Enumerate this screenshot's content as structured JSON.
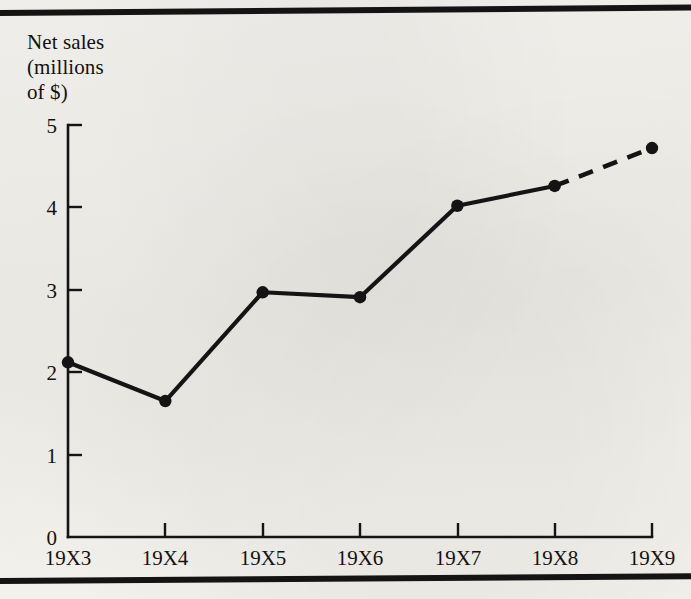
{
  "figure": {
    "axis_title": "Net sales\n(millions\nof $)",
    "ink_color": "#141414",
    "paper_color": "#f2f0ec"
  },
  "chart_data": {
    "type": "line",
    "title": "",
    "subtitle": "",
    "xlabel": "",
    "ylabel": "Net sales (millions of $)",
    "categories": [
      "19X3",
      "19X4",
      "19X5",
      "19X6",
      "19X7",
      "19X8",
      "19X9"
    ],
    "values": [
      2.12,
      1.65,
      2.97,
      2.91,
      4.02,
      4.26,
      4.72
    ],
    "series": [
      {
        "name": "Net sales",
        "values": [
          2.12,
          1.65,
          2.97,
          2.91,
          4.02,
          4.26,
          4.72
        ]
      }
    ],
    "ylim": [
      0,
      5
    ],
    "ytick_labels": [
      "0",
      "1",
      "2",
      "3",
      "4",
      "5"
    ],
    "ytick_values": [
      0,
      1,
      2,
      3,
      4,
      5
    ],
    "xtick_labels": [
      "19X3",
      "19X4",
      "19X5",
      "19X6",
      "19X7",
      "19X8",
      "19X9"
    ],
    "grid": false,
    "legend": false,
    "legend_position": "none",
    "markers": "filled-circle",
    "line_style": "solid",
    "projected_segment": {
      "from": "19X8",
      "to": "19X9",
      "style": "dashed"
    },
    "annotations": []
  }
}
